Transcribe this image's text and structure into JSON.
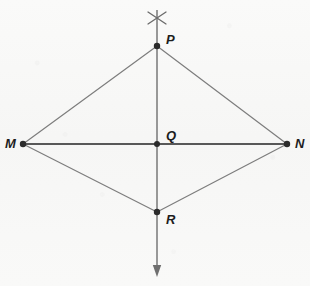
{
  "figure": {
    "background_color": "#f8f8f7",
    "stroke_color_primary": "#2b2b2b",
    "stroke_color_secondary": "#7d7d7d",
    "point_color": "#2b2b2b"
  },
  "points": [
    {
      "id": "P",
      "label": "P",
      "x": 157,
      "y": 46,
      "label_x": 166,
      "label_y": 33,
      "dot_radius": 3.2,
      "role": "apex-top"
    },
    {
      "id": "M",
      "label": "M",
      "x": 23,
      "y": 144,
      "label_x": 5,
      "label_y": 137,
      "dot_radius": 3.2,
      "role": "left-vertex"
    },
    {
      "id": "Q",
      "label": "Q",
      "x": 157,
      "y": 144,
      "label_x": 166,
      "label_y": 129,
      "dot_radius": 3.0,
      "role": "intersection"
    },
    {
      "id": "N",
      "label": "N",
      "x": 287,
      "y": 144,
      "label_x": 295,
      "label_y": 137,
      "dot_radius": 3.2,
      "role": "right-vertex"
    },
    {
      "id": "R",
      "label": "R",
      "x": 157,
      "y": 212,
      "label_x": 166,
      "label_y": 213,
      "dot_radius": 3.2,
      "role": "apex-bottom"
    }
  ],
  "segments": [
    {
      "name": "segment-MP",
      "from": "M",
      "to": "P",
      "x1": 23,
      "y1": 144,
      "x2": 157,
      "y2": 46,
      "color": "#7d7d7d",
      "width": 1.2
    },
    {
      "name": "segment-PN",
      "from": "P",
      "to": "N",
      "x1": 157,
      "y1": 46,
      "x2": 287,
      "y2": 144,
      "color": "#7d7d7d",
      "width": 1.2
    },
    {
      "name": "segment-MR",
      "from": "M",
      "to": "R",
      "x1": 23,
      "y1": 144,
      "x2": 157,
      "y2": 212,
      "color": "#7d7d7d",
      "width": 1.2
    },
    {
      "name": "segment-RN",
      "from": "R",
      "to": "N",
      "x1": 157,
      "y1": 212,
      "x2": 287,
      "y2": 144,
      "color": "#7d7d7d",
      "width": 1.2
    },
    {
      "name": "segment-MN-diagonal",
      "from": "M",
      "to": "N",
      "x1": 23,
      "y1": 144,
      "x2": 287,
      "y2": 144,
      "color": "#242424",
      "width": 1.5
    }
  ],
  "construction_line": {
    "name": "perpendicular-bisector-ray",
    "x1": 157,
    "y1": 10,
    "x2": 157,
    "y2": 276,
    "color": "#6f6f6f",
    "width": 1.4,
    "arrow": {
      "direction": "down",
      "tip_x": 157,
      "tip_y": 277,
      "half_width": 4.2,
      "length": 12
    }
  },
  "arc_mark": {
    "name": "compass-arc-intersection",
    "center_x": 157,
    "center_y": 18,
    "arm_dx": 9,
    "arm_dy": 6,
    "color": "#6a6a6a",
    "width": 1.3
  },
  "labels_note": "Vertex labels are bold italic."
}
